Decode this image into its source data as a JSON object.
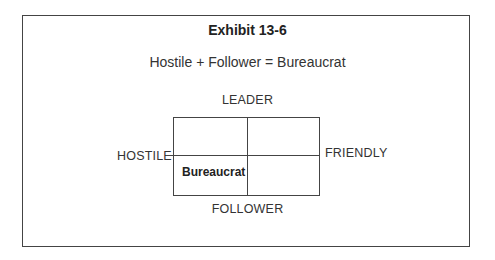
{
  "exhibit": {
    "title": "Exhibit 13-6",
    "equation": "Hostile + Follower = Bureaucrat"
  },
  "matrix": {
    "top_label": "LEADER",
    "bottom_label": "FOLLOWER",
    "left_label": "HOSTILE",
    "right_label": "FRIENDLY",
    "quadrants": {
      "top_left": "",
      "top_right": "",
      "bottom_left": "Bureaucrat",
      "bottom_right": ""
    }
  },
  "colors": {
    "line": "#444444",
    "text": "#2a2a2a"
  }
}
